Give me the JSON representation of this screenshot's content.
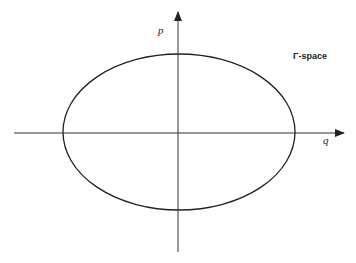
{
  "diagram": {
    "title": "Γ-space",
    "axes": {
      "horizontal_label": "q",
      "vertical_label": "p"
    },
    "shape": "ellipse",
    "colors": {
      "stroke": "#222222",
      "background": "#ffffff"
    }
  }
}
